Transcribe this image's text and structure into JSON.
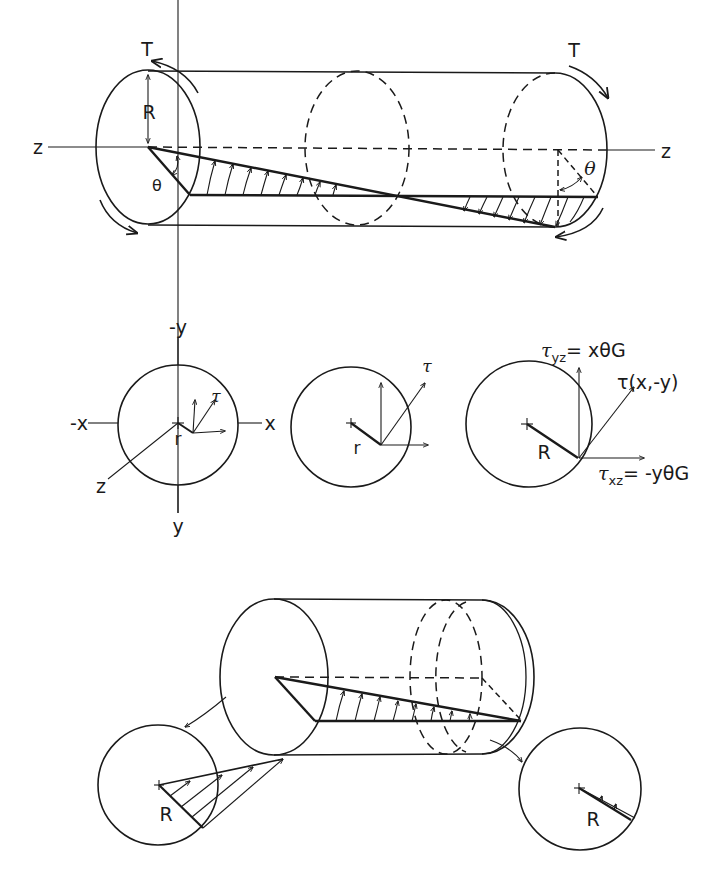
{
  "figure": {
    "top": {
      "torque_left": "T",
      "torque_right": "T",
      "radius": "R",
      "axis_left": "z",
      "axis_right": "z",
      "angle_left": "θ",
      "angle_right": "θ"
    },
    "middle": {
      "cross_section_1": {
        "axis_neg_y": "-y",
        "axis_pos_y": "y",
        "axis_neg_x": "-x",
        "axis_pos_x": "x",
        "axis_z": "z",
        "radius": "r",
        "stress": "τ"
      },
      "cross_section_2": {
        "radius": "r",
        "stress": "τ"
      },
      "cross_section_3": {
        "radius": "R",
        "tau_yz_symbol": "τ",
        "tau_yz_sub": "yz",
        "tau_yz_expr": "= xθG",
        "tau_total": "τ(x,-y)",
        "tau_xz_symbol": "τ",
        "tau_xz_sub": "xz",
        "tau_xz_expr": "= -yθG"
      }
    },
    "bottom": {
      "left_section_radius": "R",
      "right_section_radius": "R"
    }
  }
}
